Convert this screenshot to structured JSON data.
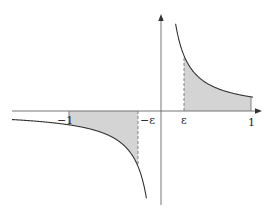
{
  "diagram": {
    "title": "",
    "colors": {
      "axis": "#666666",
      "curve": "#333333",
      "shade": "#d4d4d4",
      "dashed": "#777777",
      "text": "#222222"
    },
    "axes": {
      "x_arrow": true,
      "y_arrow": true
    },
    "tick_labels": {
      "neg_one": "−1",
      "neg_eps": "−ε",
      "eps": "ε",
      "one": "1"
    },
    "regions": [
      {
        "name": "left-shaded-region",
        "from": "-1",
        "to": "-ε",
        "side": "below axis"
      },
      {
        "name": "right-shaded-region",
        "from": "ε",
        "to": "1",
        "side": "above axis"
      }
    ]
  }
}
